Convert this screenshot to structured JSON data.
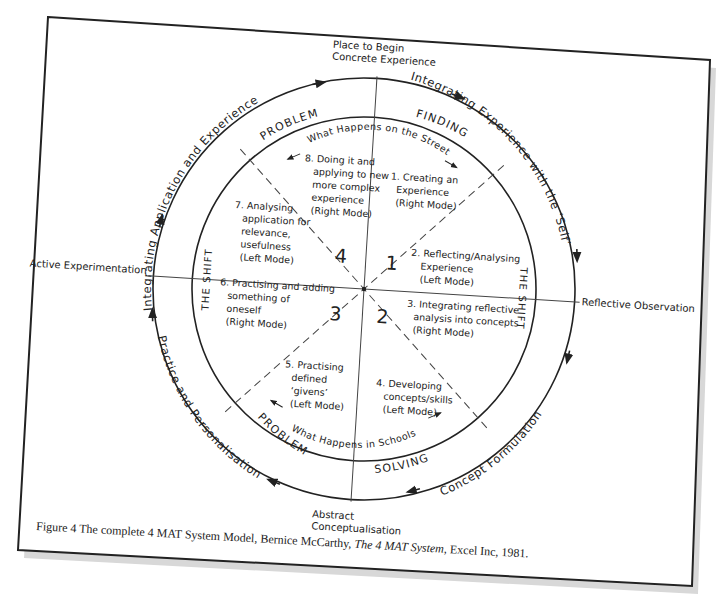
{
  "diagram": {
    "poles": {
      "top": [
        "Place to Begin",
        "Concrete Experience"
      ],
      "right": "Reflective Observation",
      "bottom": [
        "Abstract",
        "Conceptualisation"
      ],
      "left": "Active Experimentation"
    },
    "outer_ring": {
      "top_left": "Integrating Application and Experience",
      "top_right": "Integrating Experience with the ‘Self’",
      "bottom_right": "Concept Formulation",
      "bottom_left": "Practice and Personalisation"
    },
    "inner_ring": {
      "top_left": "PROBLEM",
      "top_right": "FINDING",
      "bottom_left": "PROBLEM",
      "bottom_right": "SOLVING",
      "left": "THE SHIFT",
      "right": "THE SHIFT"
    },
    "street_label": "What Happens on the Street",
    "schools_label": "What Happens in Schools",
    "quadrant_numbers": [
      "1",
      "2",
      "3",
      "4"
    ],
    "steps": [
      {
        "lines": [
          "1. Creating an",
          "Experience",
          "(Right Mode)"
        ]
      },
      {
        "lines": [
          "2. Reflecting/Analysing",
          "Experience",
          "(Left Mode)"
        ]
      },
      {
        "lines": [
          "3. Integrating reflective",
          "analysis into concepts",
          "(Right Mode)"
        ]
      },
      {
        "lines": [
          "4. Developing",
          "concepts/skills",
          "(Left Mode)"
        ]
      },
      {
        "lines": [
          "5. Practising",
          "defined",
          "‘givens’",
          "(Left Mode)"
        ]
      },
      {
        "lines": [
          "6. Practising and adding",
          "something of",
          "oneself",
          "(Right Mode)"
        ]
      },
      {
        "lines": [
          "7. Analysing",
          "application for",
          "relevance,",
          "usefulness",
          "(Left Mode)"
        ]
      },
      {
        "lines": [
          "8. Doing it and",
          "applying to new",
          "more complex",
          "experience",
          "(Right Mode)"
        ]
      }
    ]
  },
  "caption": {
    "prefix": "Figure 4 The complete 4 MAT System Model, Bernice McCarthy, ",
    "title": "The 4 MAT System",
    "suffix": ", Excel Inc, 1981."
  },
  "colors": {
    "ink": "#222222",
    "paper": "#ffffff",
    "shadow": "#d8d8d8"
  }
}
